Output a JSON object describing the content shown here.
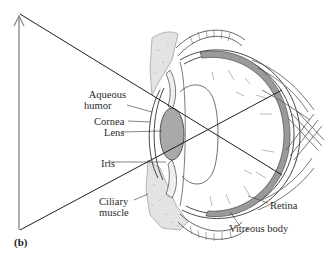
{
  "figure": {
    "panel_label": "(b)",
    "labels": {
      "aqueous_humor_line1": "Aqueous",
      "aqueous_humor_line2": "humor",
      "cornea": "Cornea",
      "lens": "Lens",
      "iris": "Iris",
      "ciliary_muscle_line1": "Ciliary",
      "ciliary_muscle_line2": "muscle",
      "retina": "Retina",
      "vitreous_body": "Vitreous body"
    },
    "colors": {
      "line": "#2b2b2b",
      "arrow": "#8a8a8a",
      "lens_fill": "#a9a9a9",
      "stipple": "#d6d6d6",
      "background": "#ffffff"
    }
  }
}
